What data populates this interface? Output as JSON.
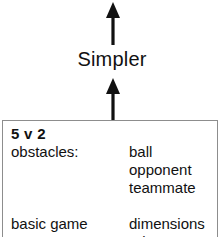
{
  "diagram": {
    "axis_label": "Simpler",
    "arrows": [
      {
        "name": "arrow-top",
        "direction": "up"
      },
      {
        "name": "arrow-bottom",
        "direction": "up"
      }
    ],
    "arrow_color": "#111111",
    "box": {
      "border_color": "#8d8d8d",
      "background": "#ffffff",
      "title": "5 v 2",
      "rows": [
        {
          "left": "obstacles:",
          "right": "ball"
        },
        {
          "left": "",
          "right": "opponent"
        },
        {
          "left": "",
          "right": "teammate"
        },
        {
          "left": "",
          "right": ""
        },
        {
          "left": "basic game",
          "right": "dimensions"
        },
        {
          "left": "",
          "right": "rules"
        }
      ]
    }
  }
}
